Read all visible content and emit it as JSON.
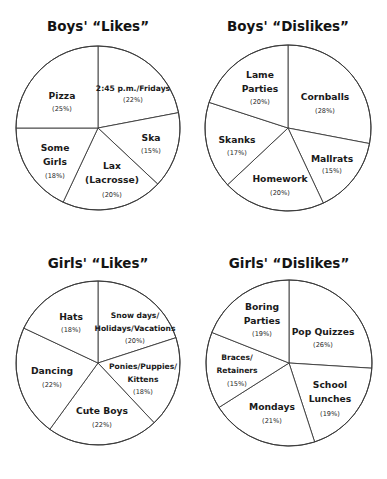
{
  "chart_data": [
    {
      "type": "pie",
      "title": "Boys' “Likes”",
      "start": "12 o'clock",
      "direction": "clockwise",
      "slices": [
        {
          "label": "2:45 p.m./Fridays",
          "lines": [
            "2:45 p.m./Fridays"
          ],
          "value": 22,
          "pct_label": "(22%)"
        },
        {
          "label": "Ska",
          "lines": [
            "Ska"
          ],
          "value": 15,
          "pct_label": "(15%)"
        },
        {
          "label": "Lax (Lacrosse)",
          "lines": [
            "Lax",
            "(Lacrosse)"
          ],
          "value": 20,
          "pct_label": "(20%)"
        },
        {
          "label": "Some Girls",
          "lines": [
            "Some",
            "Girls"
          ],
          "value": 18,
          "pct_label": "(18%)"
        },
        {
          "label": "Pizza",
          "lines": [
            "Pizza"
          ],
          "value": 25,
          "pct_label": "(25%)"
        }
      ]
    },
    {
      "type": "pie",
      "title": "Boys' “Dislikes”",
      "start": "12 o'clock",
      "direction": "clockwise",
      "slices": [
        {
          "label": "Cornballs",
          "lines": [
            "Cornballs"
          ],
          "value": 28,
          "pct_label": "(28%)"
        },
        {
          "label": "Mallrats",
          "lines": [
            "Mallrats"
          ],
          "value": 15,
          "pct_label": "(15%)"
        },
        {
          "label": "Homework",
          "lines": [
            "Homework"
          ],
          "value": 20,
          "pct_label": "(20%)"
        },
        {
          "label": "Skanks",
          "lines": [
            "Skanks"
          ],
          "value": 17,
          "pct_label": "(17%)"
        },
        {
          "label": "Lame Parties",
          "lines": [
            "Lame",
            "Parties"
          ],
          "value": 20,
          "pct_label": "(20%)"
        }
      ]
    },
    {
      "type": "pie",
      "title": "Girls' “Likes”",
      "start": "12 o'clock",
      "direction": "clockwise",
      "slices": [
        {
          "label": "Snow days/Holidays/Vacations",
          "lines": [
            "Snow days/",
            "Holidays/Vacations"
          ],
          "value": 20,
          "pct_label": "(20%)"
        },
        {
          "label": "Ponies/Puppies/Kittens",
          "lines": [
            "Ponies/Puppies/",
            "Kittens"
          ],
          "value": 18,
          "pct_label": "(18%)"
        },
        {
          "label": "Cute Boys",
          "lines": [
            "Cute Boys"
          ],
          "value": 22,
          "pct_label": "(22%)"
        },
        {
          "label": "Dancing",
          "lines": [
            "Dancing"
          ],
          "value": 22,
          "pct_label": "(22%)"
        },
        {
          "label": "Hats",
          "lines": [
            "Hats"
          ],
          "value": 18,
          "pct_label": "(18%)"
        }
      ]
    },
    {
      "type": "pie",
      "title": "Girls' “Dislikes”",
      "start": "12 o'clock",
      "direction": "clockwise",
      "slices": [
        {
          "label": "Pop Quizzes",
          "lines": [
            "Pop Quizzes"
          ],
          "value": 26,
          "pct_label": "(26%)"
        },
        {
          "label": "School Lunches",
          "lines": [
            "School",
            "Lunches"
          ],
          "value": 19,
          "pct_label": "(19%)"
        },
        {
          "label": "Mondays",
          "lines": [
            "Mondays"
          ],
          "value": 21,
          "pct_label": "(21%)"
        },
        {
          "label": "Braces/Retainers",
          "lines": [
            "Braces/",
            "Retainers"
          ],
          "value": 15,
          "pct_label": "(15%)"
        },
        {
          "label": "Boring Parties",
          "lines": [
            "Boring",
            "Parties"
          ],
          "value": 19,
          "pct_label": "(19%)"
        }
      ]
    }
  ]
}
